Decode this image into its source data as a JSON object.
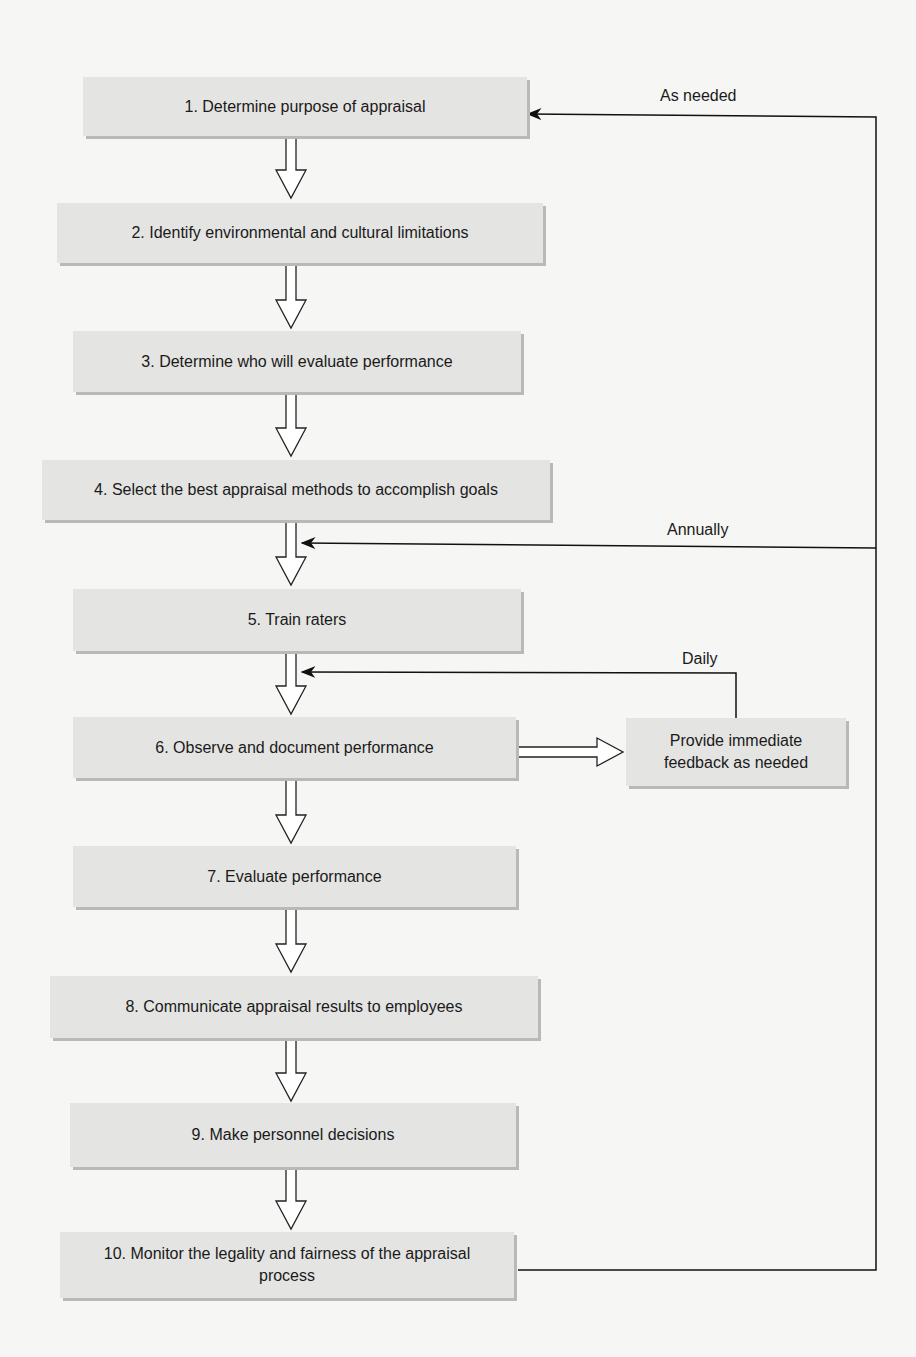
{
  "diagram": {
    "type": "flowchart",
    "steps": [
      {
        "id": 1,
        "label": "1. Determine purpose of appraisal"
      },
      {
        "id": 2,
        "label": "2. Identify environmental and cultural limitations"
      },
      {
        "id": 3,
        "label": "3. Determine who will evaluate performance"
      },
      {
        "id": 4,
        "label": "4. Select the best appraisal methods to accomplish goals"
      },
      {
        "id": 5,
        "label": "5. Train raters"
      },
      {
        "id": 6,
        "label": "6. Observe and document performance"
      },
      {
        "id": 7,
        "label": "7. Evaluate performance"
      },
      {
        "id": 8,
        "label": "8. Communicate appraisal results to employees"
      },
      {
        "id": 9,
        "label": "9. Make personnel decisions"
      },
      {
        "id": 10,
        "label": "10. Monitor the legality and fairness of the appraisal process"
      }
    ],
    "side_box": {
      "label": "Provide immediate feedback as needed"
    },
    "feedback_labels": {
      "as_needed": "As needed",
      "annually": "Annually",
      "daily": "Daily"
    }
  }
}
